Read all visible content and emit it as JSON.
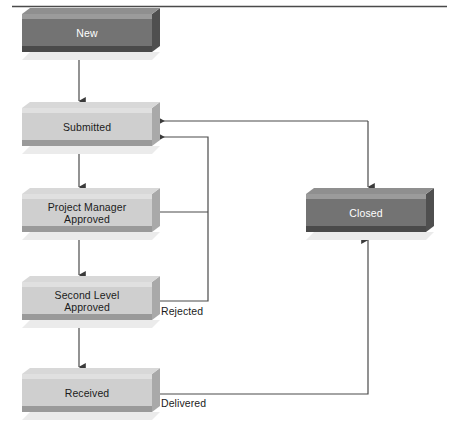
{
  "diagram": {
    "title_rule": "horizontal-rule",
    "colors": {
      "page_background": "#ffffff",
      "rule": "#4a4a4a",
      "light_node_face": "#cfcfcf",
      "light_node_top_bevel": "#e0e0e0",
      "light_node_side": "#a9a9a9",
      "light_node_bottom": "#9a9a9a",
      "light_node_shadow": "#ebebeb",
      "dark_node_face": "#737373",
      "dark_node_top_bevel": "#9b9b9b",
      "dark_node_side": "#4f4f4f",
      "dark_node_bottom": "#4a4a4a",
      "dark_node_text": "#ffffff",
      "light_node_text": "#1b1b1b",
      "connector": "#4a4a4a"
    },
    "nodes": [
      {
        "id": "new",
        "label": "New",
        "style": "dark",
        "x": 22,
        "y": 14,
        "w": 130,
        "h": 38
      },
      {
        "id": "submitted",
        "label": "Submitted",
        "style": "light",
        "x": 22,
        "y": 108,
        "w": 130,
        "h": 38
      },
      {
        "id": "pm",
        "label": "Project Manager\nApproved",
        "style": "light",
        "x": 22,
        "y": 194,
        "w": 130,
        "h": 38
      },
      {
        "id": "second",
        "label": "Second Level\nApproved",
        "style": "light",
        "x": 22,
        "y": 282,
        "w": 130,
        "h": 38
      },
      {
        "id": "received",
        "label": "Received",
        "style": "light",
        "x": 22,
        "y": 374,
        "w": 130,
        "h": 38
      },
      {
        "id": "closed",
        "label": "Closed",
        "style": "dark",
        "x": 306,
        "y": 194,
        "w": 120,
        "h": 38
      }
    ],
    "edges": [
      {
        "id": "new-to-submitted",
        "label": "",
        "from": "new",
        "to": "submitted"
      },
      {
        "id": "submitted-to-pm",
        "label": "",
        "from": "submitted",
        "to": "pm"
      },
      {
        "id": "pm-to-second",
        "label": "",
        "from": "pm",
        "to": "second"
      },
      {
        "id": "second-to-received",
        "label": "",
        "from": "second",
        "to": "received"
      },
      {
        "id": "pm-rejected",
        "label": "",
        "from": "pm",
        "to": "submitted"
      },
      {
        "id": "second-rejected",
        "label": "Rejected",
        "from": "second",
        "to": "submitted"
      },
      {
        "id": "received-delivered",
        "label": "Delivered",
        "from": "received",
        "to": "closed"
      },
      {
        "id": "closed-to-submitted",
        "label": "",
        "from": "closed",
        "to": "submitted"
      }
    ],
    "edge_labels": [
      {
        "id": "rejected",
        "text": "Rejected",
        "x": 161,
        "y": 310
      },
      {
        "id": "delivered",
        "text": "Delivered",
        "x": 161,
        "y": 402
      }
    ]
  }
}
